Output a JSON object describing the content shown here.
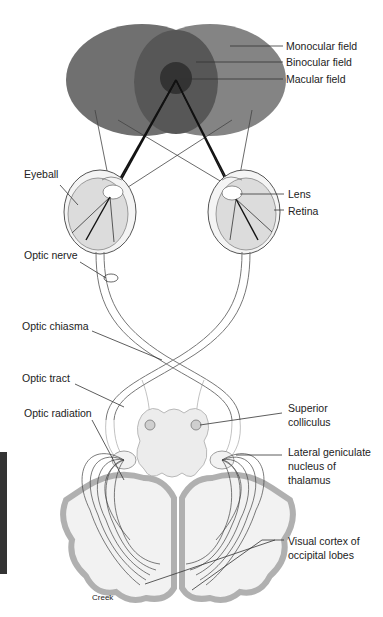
{
  "diagram": {
    "colors": {
      "monocular_field": "#6e6e6e",
      "binocular_field": "#555555",
      "macular_field": "#333333",
      "tissue_fill": "#e6e6e6",
      "cortex_band": "#b5b5b5",
      "line": "#333333"
    },
    "labels": {
      "monocular_field": "Monocular field",
      "binocular_field": "Binocular field",
      "macular_field": "Macular field",
      "eyeball": "Eyeball",
      "lens": "Lens",
      "retina": "Retina",
      "optic_nerve": "Optic nerve",
      "optic_chiasma": "Optic chiasma",
      "optic_tract": "Optic tract",
      "optic_radiation": "Optic radiation",
      "superior_colliculus_1": "Superior",
      "superior_colliculus_2": "colliculus",
      "lgn_1": "Lateral geniculate",
      "lgn_2": "nucleus of",
      "lgn_3": "thalamus",
      "visual_cortex_1": "Visual cortex of",
      "visual_cortex_2": "occipital lobes",
      "credit": "Creek"
    }
  }
}
